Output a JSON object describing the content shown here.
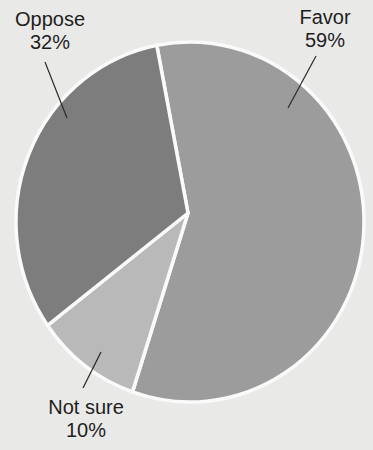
{
  "chart_data": {
    "type": "pie",
    "title": "",
    "slices": [
      {
        "label": "Favor",
        "value": 59,
        "display": "59%",
        "color": "#9c9c9c"
      },
      {
        "label": "Not sure",
        "value": 10,
        "display": "10%",
        "color": "#b9b9b9"
      },
      {
        "label": "Oppose",
        "value": 32,
        "display": "32%",
        "color": "#7d7d7d"
      }
    ],
    "start_angle_deg": -11,
    "legend": "none",
    "labels_position": "outside with leader lines"
  },
  "labels": {
    "favor_name": "Favor",
    "favor_pct": "59%",
    "oppose_name": "Oppose",
    "oppose_pct": "32%",
    "notsure_name": "Not sure",
    "notsure_pct": "10%"
  }
}
